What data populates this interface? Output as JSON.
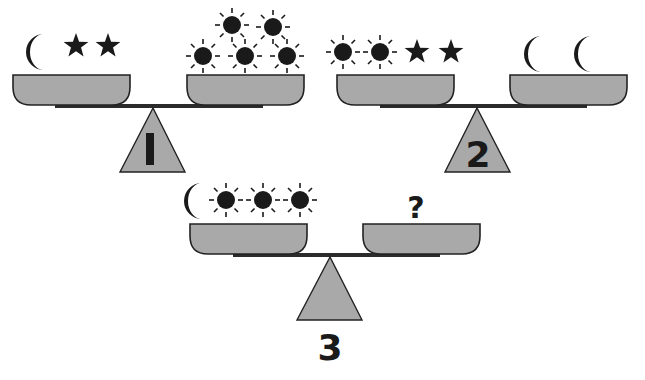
{
  "puzzle": {
    "type": "balance-scale logic puzzle",
    "colors": {
      "pan": "#a9a9a9",
      "ink": "#1a1a1a",
      "background": "#ffffff"
    },
    "scales": [
      {
        "label": "1",
        "left_pan": [
          "moon",
          "star",
          "star"
        ],
        "right_pan": [
          "sun",
          "sun",
          "sun",
          "sun",
          "sun"
        ],
        "balanced": true
      },
      {
        "label": "2",
        "left_pan": [
          "sun",
          "sun",
          "star",
          "star"
        ],
        "right_pan": [
          "moon",
          "moon"
        ],
        "balanced": true
      },
      {
        "label": "3",
        "left_pan": [
          "moon",
          "sun",
          "sun",
          "sun"
        ],
        "right_pan": [
          "?"
        ],
        "balanced": true
      }
    ],
    "question_mark": "?"
  }
}
